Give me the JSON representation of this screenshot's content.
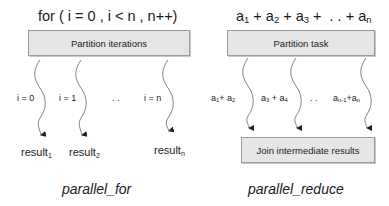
{
  "left": {
    "header": "for ( i = 0 , i < n , n++)",
    "box_label": "Partition iterations",
    "branches": [
      {
        "label": "i = 0",
        "result": "result",
        "result_sub": "1"
      },
      {
        "label": "i = 1",
        "result": "result",
        "result_sub": "2"
      },
      {
        "label": "i = n",
        "result": "result",
        "result_sub": "n"
      }
    ],
    "ellipsis": ". .",
    "caption": "parallel_for"
  },
  "right": {
    "header_terms": [
      {
        "base": "a",
        "sub": "1"
      },
      {
        "base": "a",
        "sub": "2"
      },
      {
        "base": "a",
        "sub": "3"
      },
      {
        "base": "a",
        "sub": "n"
      }
    ],
    "header_sep": " + ",
    "header_ellipsis": ". . +",
    "box_label": "Partition task",
    "branches": [
      {
        "a": "a",
        "a_sub": "1",
        "op": "+ ",
        "b": "a",
        "b_sub": "2"
      },
      {
        "a": "a",
        "a_sub": "3",
        "op": " + ",
        "b": "a",
        "b_sub": "4"
      },
      {
        "a": "a",
        "a_sub": "n-1",
        "op": "+",
        "b": "a",
        "b_sub": "n"
      }
    ],
    "ellipsis": ". .",
    "join_label": "Join intermediate results",
    "caption": "parallel_reduce"
  },
  "colors": {
    "box_fill": "#e6e6e6",
    "box_border": "#9a9a9a",
    "line": "#555555",
    "arrow": "#222222"
  }
}
